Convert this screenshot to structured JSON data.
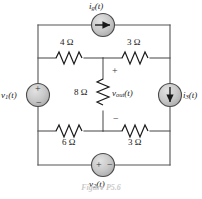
{
  "figure": {
    "caption": "Figure P5.6",
    "wire_color": "#555555",
    "source_fill": "#c0c0c0",
    "source_stroke": "#4a4a4a",
    "text_color": "#1a1a1a"
  },
  "components": {
    "r_top_left": {
      "label": "4 Ω",
      "value": 4,
      "unit": "Ω",
      "position": "top-left-branch"
    },
    "r_top_right": {
      "label": "3 Ω",
      "value": 3,
      "unit": "Ω",
      "position": "top-right-branch"
    },
    "r_center": {
      "label": "8 Ω",
      "value": 8,
      "unit": "Ω",
      "position": "center-vertical-branch"
    },
    "r_bottom_left": {
      "label": "6 Ω",
      "value": 6,
      "unit": "Ω",
      "position": "bottom-left-branch"
    },
    "r_bottom_right": {
      "label": "3 Ω",
      "value": 3,
      "unit": "Ω",
      "position": "bottom-right-branch"
    }
  },
  "sources": {
    "i_top": {
      "name": "i",
      "subscript": "g",
      "arg": "(t)",
      "type": "current-source",
      "arrow": "right",
      "position": "top-rail"
    },
    "v_left": {
      "name": "v",
      "subscript": "1",
      "arg": "(t)",
      "type": "voltage-source",
      "plus": "+",
      "minus": "−",
      "orientation": "vertical",
      "position": "left-rail"
    },
    "i_right": {
      "name": "i",
      "subscript": "3",
      "arg": "(t)",
      "type": "current-source",
      "arrow": "down",
      "position": "right-rail"
    },
    "v_bottom": {
      "name": "v",
      "subscript": "2",
      "arg": "(t)",
      "type": "voltage-source",
      "plus": "+",
      "minus": "−",
      "orientation": "horizontal",
      "position": "bottom-rail"
    }
  },
  "measurements": {
    "v_out": {
      "name": "v",
      "subscript": "out",
      "arg": "(t)",
      "plus": "+",
      "minus": "−",
      "across": "r_center"
    }
  }
}
